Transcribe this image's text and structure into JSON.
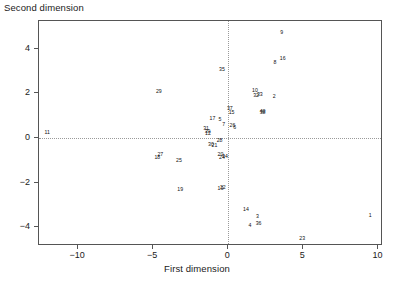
{
  "chart_data": {
    "type": "scatter",
    "title": "",
    "xlabel": "First dimension",
    "ylabel": "Second dimension",
    "xlim": [
      -12.6,
      10.3
    ],
    "ylim": [
      -4.85,
      5.25
    ],
    "xticks": [
      -10,
      -5,
      0,
      5,
      10
    ],
    "xticklabels": [
      "−10",
      "−5",
      "0",
      "5",
      "10"
    ],
    "yticks": [
      -4,
      -2,
      0,
      2,
      4
    ],
    "yticklabels": [
      "−4",
      "−2",
      "0",
      "2",
      "4"
    ],
    "grid": false,
    "reference_lines": {
      "vertical_x": 0,
      "horizontal_y": 0,
      "style": "dotted"
    },
    "legend": "none",
    "marker_style": "text-label",
    "points": [
      {
        "label": "1",
        "x": 9.45,
        "y": -3.52
      },
      {
        "label": "2",
        "x": 3.05,
        "y": 1.83
      },
      {
        "label": "3",
        "x": 1.95,
        "y": -3.55
      },
      {
        "label": "4",
        "x": 1.45,
        "y": -3.93
      },
      {
        "label": "5",
        "x": -0.55,
        "y": 0.8
      },
      {
        "label": "6",
        "x": 0.42,
        "y": 0.46
      },
      {
        "label": "7",
        "x": -0.3,
        "y": 0.58
      },
      {
        "label": "8",
        "x": 3.1,
        "y": 3.36
      },
      {
        "label": "9",
        "x": 3.55,
        "y": 4.72
      },
      {
        "label": "10",
        "x": 1.78,
        "y": 2.12
      },
      {
        "label": "11",
        "x": -12.05,
        "y": 0.22
      },
      {
        "label": "12",
        "x": -1.35,
        "y": 0.18
      },
      {
        "label": "13",
        "x": -0.52,
        "y": -2.3
      },
      {
        "label": "14",
        "x": 1.18,
        "y": -3.25
      },
      {
        "label": "15",
        "x": 0.22,
        "y": 1.1
      },
      {
        "label": "16",
        "x": 3.62,
        "y": 3.55
      },
      {
        "label": "17",
        "x": -1.05,
        "y": 0.85
      },
      {
        "label": "18",
        "x": -4.72,
        "y": -0.9
      },
      {
        "label": "19",
        "x": -3.2,
        "y": -2.35
      },
      {
        "label": "20",
        "x": -0.52,
        "y": -0.78
      },
      {
        "label": "21",
        "x": -0.92,
        "y": -0.38
      },
      {
        "label": "22",
        "x": -0.36,
        "y": -2.26
      },
      {
        "label": "23",
        "x": 4.92,
        "y": -4.52
      },
      {
        "label": "24",
        "x": -0.42,
        "y": -0.88
      },
      {
        "label": "25",
        "x": -3.28,
        "y": -1.02
      },
      {
        "label": "26",
        "x": 0.28,
        "y": 0.52
      },
      {
        "label": "27",
        "x": -4.52,
        "y": -0.78
      },
      {
        "label": "28",
        "x": -0.58,
        "y": -0.13
      },
      {
        "label": "29",
        "x": -4.62,
        "y": 2.06
      },
      {
        "label": "30",
        "x": -1.15,
        "y": -0.32
      },
      {
        "label": "31",
        "x": -1.48,
        "y": 0.42
      },
      {
        "label": "32",
        "x": 1.85,
        "y": 1.88
      },
      {
        "label": "33",
        "x": 2.1,
        "y": 1.93
      },
      {
        "label": "34",
        "x": -0.22,
        "y": -0.86
      },
      {
        "label": "35",
        "x": -0.42,
        "y": 3.06
      },
      {
        "label": "36",
        "x": 2.02,
        "y": -3.88
      },
      {
        "label": "37",
        "x": 0.1,
        "y": 1.28
      },
      {
        "label": "38",
        "x": 2.28,
        "y": 1.14
      },
      {
        "label": "39",
        "x": -1.38,
        "y": 0.26
      },
      {
        "label": "40",
        "x": 2.28,
        "y": 1.18
      }
    ]
  },
  "axes": {
    "xlabel": "First dimension",
    "ylabel": "Second dimension"
  },
  "colors": {
    "frame": "#555555",
    "reference_line": "#9a9a9a",
    "text": "#1a1a1a",
    "point_label": "#111111",
    "background": "#ffffff"
  }
}
